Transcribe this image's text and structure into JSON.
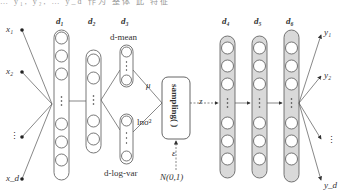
{
  "top_cut_text": "…  y₁, y₂, …  y_d 作为 整体 此 特征",
  "inputs": [
    {
      "label": "x₁"
    },
    {
      "label": "x₂"
    },
    {
      "label": "⋮"
    },
    {
      "label": "x_d"
    }
  ],
  "outputs": [
    {
      "label": "y₁"
    },
    {
      "label": "y₂"
    },
    {
      "label": "⋮"
    },
    {
      "label": "y_d"
    }
  ],
  "layers": {
    "d1": "d₁",
    "d2": "d₂",
    "d3": "d₃",
    "d4": "d₄",
    "d5": "d₅",
    "d6": "d₆"
  },
  "encoder_heads": {
    "mean_label": "d-mean",
    "logvar_label": "d-log-var",
    "mu": "μ",
    "lnsigma": "lnσ²"
  },
  "sampling": {
    "label": "sampling( )",
    "epsilon": "ε",
    "noise": "N(0,1)",
    "z": "z"
  },
  "colors": {
    "line": "#555555",
    "decoder_fill": "#d9d9d9",
    "encoder_fill": "#ffffff"
  }
}
